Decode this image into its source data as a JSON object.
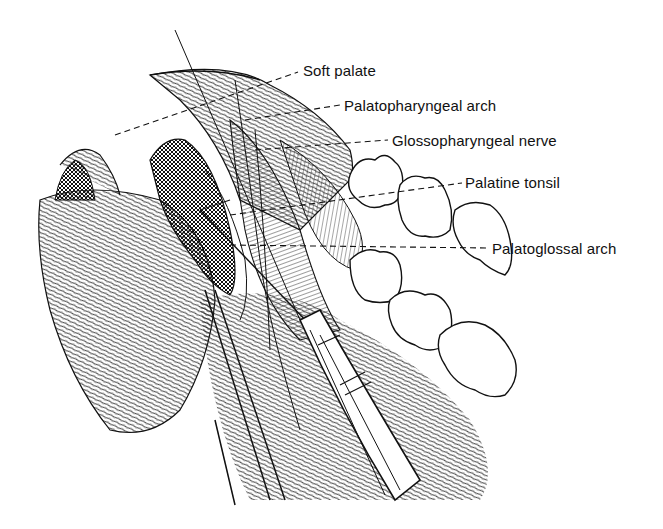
{
  "figure": {
    "type": "anatomical line illustration",
    "labels": [
      {
        "id": "soft-palate",
        "text": "Soft palate"
      },
      {
        "id": "palatopharyngeal-arch",
        "text": "Palatopharyngeal arch"
      },
      {
        "id": "glossopharyngeal-nerve",
        "text": "Glossopharyngeal nerve"
      },
      {
        "id": "palatine-tonsil",
        "text": "Palatine tonsil"
      },
      {
        "id": "palatoglossal-arch",
        "text": "Palatoglossal arch"
      }
    ]
  }
}
